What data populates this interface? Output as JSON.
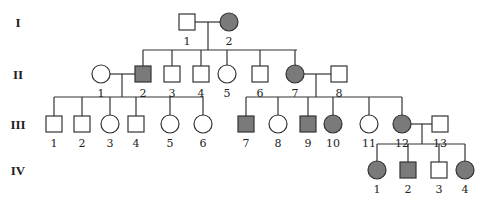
{
  "colors": {
    "affected": "#7a7a7a",
    "unaffected": "#ffffff",
    "stroke": "#333333"
  },
  "generations": [
    {
      "label": "I",
      "y": 22
    },
    {
      "label": "II",
      "y": 74
    },
    {
      "label": "III",
      "y": 124
    },
    {
      "label": "IV",
      "y": 170
    }
  ],
  "individuals": [
    {
      "id": "I-1",
      "num": "1",
      "sex": "male",
      "affected": false,
      "x": 187,
      "y": 22
    },
    {
      "id": "I-2",
      "num": "2",
      "sex": "female",
      "affected": true,
      "x": 229,
      "y": 22
    },
    {
      "id": "II-1",
      "num": "1",
      "sex": "female",
      "affected": false,
      "x": 101,
      "y": 74
    },
    {
      "id": "II-2",
      "num": "2",
      "sex": "male",
      "affected": true,
      "x": 143,
      "y": 74
    },
    {
      "id": "II-3",
      "num": "3",
      "sex": "male",
      "affected": false,
      "x": 172,
      "y": 74
    },
    {
      "id": "II-4",
      "num": "4",
      "sex": "male",
      "affected": false,
      "x": 201,
      "y": 74
    },
    {
      "id": "II-5",
      "num": "5",
      "sex": "female",
      "affected": false,
      "x": 227,
      "y": 74
    },
    {
      "id": "II-6",
      "num": "6",
      "sex": "male",
      "affected": false,
      "x": 260,
      "y": 74
    },
    {
      "id": "II-7",
      "num": "7",
      "sex": "female",
      "affected": true,
      "x": 295,
      "y": 74
    },
    {
      "id": "II-8",
      "num": "8",
      "sex": "male",
      "affected": false,
      "x": 339,
      "y": 74
    },
    {
      "id": "III-1",
      "num": "1",
      "sex": "male",
      "affected": false,
      "x": 54,
      "y": 124
    },
    {
      "id": "III-2",
      "num": "2",
      "sex": "male",
      "affected": false,
      "x": 82,
      "y": 124
    },
    {
      "id": "III-3",
      "num": "3",
      "sex": "female",
      "affected": false,
      "x": 110,
      "y": 124
    },
    {
      "id": "III-4",
      "num": "4",
      "sex": "male",
      "affected": false,
      "x": 136,
      "y": 124
    },
    {
      "id": "III-5",
      "num": "5",
      "sex": "female",
      "affected": false,
      "x": 170,
      "y": 124
    },
    {
      "id": "III-6",
      "num": "6",
      "sex": "female",
      "affected": false,
      "x": 203,
      "y": 124
    },
    {
      "id": "III-7",
      "num": "7",
      "sex": "male",
      "affected": true,
      "x": 246,
      "y": 124
    },
    {
      "id": "III-8",
      "num": "8",
      "sex": "female",
      "affected": false,
      "x": 278,
      "y": 124
    },
    {
      "id": "III-9",
      "num": "9",
      "sex": "male",
      "affected": true,
      "x": 308,
      "y": 124
    },
    {
      "id": "III-10",
      "num": "10",
      "sex": "female",
      "affected": true,
      "x": 333,
      "y": 124
    },
    {
      "id": "III-11",
      "num": "11",
      "sex": "female",
      "affected": false,
      "x": 369,
      "y": 124
    },
    {
      "id": "III-12",
      "num": "12",
      "sex": "female",
      "affected": true,
      "x": 402,
      "y": 124
    },
    {
      "id": "III-13",
      "num": "13",
      "sex": "male",
      "affected": false,
      "x": 440,
      "y": 124
    },
    {
      "id": "IV-1",
      "num": "1",
      "sex": "female",
      "affected": true,
      "x": 377,
      "y": 170
    },
    {
      "id": "IV-2",
      "num": "2",
      "sex": "male",
      "affected": true,
      "x": 408,
      "y": 170
    },
    {
      "id": "IV-3",
      "num": "3",
      "sex": "male",
      "affected": false,
      "x": 439,
      "y": 170
    },
    {
      "id": "IV-4",
      "num": "4",
      "sex": "female",
      "affected": true,
      "x": 465,
      "y": 170
    }
  ],
  "lines": [
    [
      195,
      22,
      221,
      22
    ],
    [
      208,
      22,
      208,
      50
    ],
    [
      143,
      50,
      297,
      50
    ],
    [
      143,
      50,
      143,
      66
    ],
    [
      172,
      50,
      172,
      66
    ],
    [
      201,
      50,
      201,
      66
    ],
    [
      227,
      50,
      227,
      66
    ],
    [
      260,
      50,
      260,
      66
    ],
    [
      295,
      50,
      295,
      66
    ],
    [
      109,
      74,
      135,
      74
    ],
    [
      122,
      74,
      122,
      97
    ],
    [
      54,
      97,
      203,
      97
    ],
    [
      54,
      97,
      54,
      116
    ],
    [
      82,
      97,
      82,
      116
    ],
    [
      110,
      97,
      110,
      116
    ],
    [
      136,
      97,
      136,
      116
    ],
    [
      170,
      97,
      170,
      116
    ],
    [
      203,
      97,
      203,
      116
    ],
    [
      303,
      74,
      331,
      74
    ],
    [
      316,
      74,
      316,
      97
    ],
    [
      246,
      97,
      402,
      97
    ],
    [
      246,
      97,
      246,
      116
    ],
    [
      278,
      97,
      278,
      116
    ],
    [
      308,
      97,
      308,
      116
    ],
    [
      333,
      97,
      333,
      116
    ],
    [
      369,
      97,
      369,
      116
    ],
    [
      402,
      97,
      402,
      116
    ],
    [
      410,
      124,
      432,
      124
    ],
    [
      422,
      124,
      422,
      144
    ],
    [
      377,
      144,
      465,
      144
    ],
    [
      377,
      144,
      377,
      162
    ],
    [
      408,
      144,
      408,
      162
    ],
    [
      439,
      144,
      439,
      162
    ],
    [
      465,
      144,
      465,
      162
    ]
  ]
}
